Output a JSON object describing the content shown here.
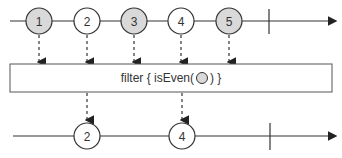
{
  "diagram": {
    "type": "marble-diagram",
    "operator_label_prefix": "filter { isEven(",
    "operator_label_suffix": ") }",
    "input_stream": {
      "marbles": [
        {
          "value": "1",
          "filled": true
        },
        {
          "value": "2",
          "filled": false
        },
        {
          "value": "3",
          "filled": true
        },
        {
          "value": "4",
          "filled": false
        },
        {
          "value": "5",
          "filled": true
        }
      ],
      "completes": true
    },
    "output_stream": {
      "marbles": [
        {
          "value": "2",
          "filled": false
        },
        {
          "value": "4",
          "filled": false
        }
      ],
      "completes": true
    },
    "colors": {
      "filled_marble": "#d9d9d9",
      "empty_marble": "#ffffff",
      "stroke": "#333333"
    }
  }
}
